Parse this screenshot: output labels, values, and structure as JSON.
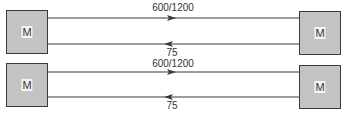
{
  "diagram": {
    "rows": [
      {
        "left_node": {
          "label": "M"
        },
        "right_node": {
          "label": "M"
        },
        "forward_link": {
          "label": "600/1200",
          "direction": "right"
        },
        "return_link": {
          "label": "75",
          "direction": "left"
        }
      },
      {
        "left_node": {
          "label": "M"
        },
        "right_node": {
          "label": "M"
        },
        "forward_link": {
          "label": "600/1200",
          "direction": "right"
        },
        "return_link": {
          "label": "75",
          "direction": "left"
        }
      }
    ],
    "colors": {
      "line": "#3a3a3a",
      "box_fill": "#c8c8c8",
      "box_border": "#3a3a3a"
    }
  }
}
